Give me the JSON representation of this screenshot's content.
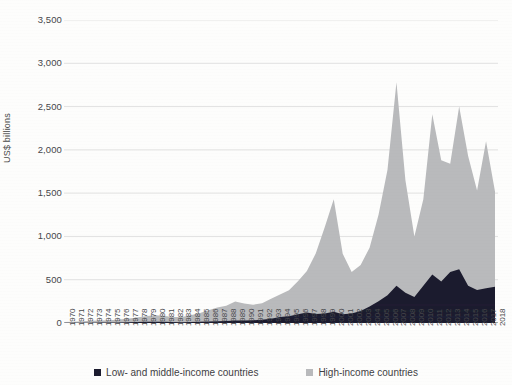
{
  "axis": {
    "ylabel": "US$ billions",
    "yticks": [
      "0",
      "500",
      "1,000",
      "1,500",
      "2,000",
      "2,500",
      "3,000",
      "3,500"
    ]
  },
  "legend": {
    "items": [
      {
        "label": "Low- and middle-income countries",
        "color": "#1b1b2e"
      },
      {
        "label": "High-income countries",
        "color": "#b9babc"
      }
    ]
  },
  "chart_data": {
    "type": "area",
    "title": "",
    "subtitle": "",
    "xlabel": "",
    "ylabel": "US$ billions",
    "ylim": [
      0,
      3500
    ],
    "ytick_step": 500,
    "grid": true,
    "legend_position": "bottom",
    "stacked": true,
    "x": [
      1970,
      1971,
      1972,
      1973,
      1974,
      1975,
      1976,
      1977,
      1978,
      1979,
      1980,
      1981,
      1982,
      1983,
      1984,
      1985,
      1986,
      1987,
      1988,
      1989,
      1990,
      1991,
      1992,
      1993,
      1994,
      1995,
      1996,
      1997,
      1998,
      1999,
      2000,
      2001,
      2002,
      2003,
      2004,
      2005,
      2006,
      2007,
      2008,
      2009,
      2010,
      2011,
      2012,
      2013,
      2014,
      2015,
      2016,
      2017,
      2018
    ],
    "categories": [
      "1970",
      "1971",
      "1972",
      "1973",
      "1974",
      "1975",
      "1976",
      "1977",
      "1978",
      "1979",
      "1980",
      "1981",
      "1982",
      "1983",
      "1984",
      "1985",
      "1986",
      "1987",
      "1988",
      "1989",
      "1990",
      "1991",
      "1992",
      "1993",
      "1994",
      "1995",
      "1996",
      "1997",
      "1998",
      "1999",
      "2000",
      "2001",
      "2002",
      "2003",
      "2004",
      "2005",
      "2006",
      "2007",
      "2008",
      "2009",
      "2010",
      "2011",
      "2012",
      "2013",
      "2014",
      "2015",
      "2016",
      "2017",
      "2018"
    ],
    "series": [
      {
        "name": "Low- and middle-income countries",
        "color": "#1b1b2e",
        "values": [
          2,
          2,
          3,
          4,
          5,
          6,
          7,
          9,
          11,
          13,
          14,
          14,
          12,
          10,
          12,
          14,
          16,
          20,
          24,
          28,
          30,
          32,
          38,
          50,
          68,
          78,
          102,
          120,
          105,
          110,
          130,
          100,
          110,
          140,
          190,
          250,
          320,
          430,
          350,
          300,
          430,
          560,
          480,
          590,
          620,
          430,
          380,
          400,
          420
        ]
      },
      {
        "name": "High-income countries",
        "color": "#b9babc",
        "values": [
          10,
          12,
          16,
          22,
          24,
          26,
          32,
          40,
          52,
          64,
          76,
          70,
          58,
          60,
          78,
          100,
          130,
          160,
          175,
          220,
          195,
          180,
          190,
          230,
          260,
          300,
          380,
          480,
          700,
          1000,
          1300,
          700,
          480,
          530,
          680,
          1000,
          1450,
          2350,
          1300,
          700,
          1000,
          1850,
          1400,
          1250,
          1880,
          1500,
          1150,
          1700,
          1100
        ]
      }
    ],
    "annotations": [
      {
        "text": "peak total ~3,100",
        "x": 2007,
        "y": 3100
      },
      {
        "text": "local peak ~1,430",
        "x": 2000,
        "y": 1430
      },
      {
        "text": "peak ~2,400",
        "x": 2011,
        "y": 2410
      },
      {
        "text": "peak ~2,500",
        "x": 2014,
        "y": 2500
      }
    ]
  }
}
